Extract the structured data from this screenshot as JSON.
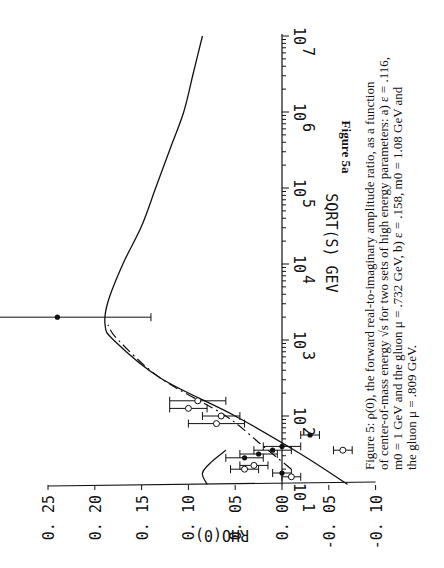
{
  "figure": {
    "label": "Figure 5a",
    "caption_lines": [
      "Figure 5: ρ(0), the forward real-to-imaginary amplitude ratio, as a function",
      "of center-of-mass energy √s for two sets of high energy parameters: a) ε = .116,",
      "m0 = 1 GeV and the gluon μ = .732 GeV, b) ε = .158, m0 = 1.08 GeV and",
      "the gluon μ = .809 GeV."
    ],
    "orientation": "rotated 90° clockwise"
  },
  "chart_data": {
    "type": "line",
    "title": "",
    "xlabel": "SQRT(S) GEV",
    "ylabel": "RHO(0)",
    "x_scale": "log",
    "x_tick_labels": [
      "10^1",
      "10^2",
      "10^3",
      "10^4",
      "10^5",
      "10^6",
      "10^7"
    ],
    "y_tick_labels": [
      "0.25",
      "0.20",
      "0.15",
      "0.10",
      "0.05",
      "0.00",
      "-0.05",
      "-0.10"
    ],
    "ylim": [
      -0.1,
      0.25
    ],
    "xlim_log10": [
      1.1,
      7.0
    ],
    "grid": false,
    "series": [
      {
        "name": "a) eps=.116, m0=1 GeV, gluon mu=.732 GeV (solid)",
        "style": "solid",
        "log10_sqrt_s": [
          1.1,
          1.5,
          2.0,
          2.5,
          3.0,
          3.2,
          3.5,
          4.0,
          4.5,
          5.0,
          5.5,
          6.0,
          6.5,
          7.0
        ],
        "rho": [
          -0.07,
          -0.02,
          0.05,
          0.13,
          0.18,
          0.189,
          0.186,
          0.17,
          0.15,
          0.135,
          0.12,
          0.105,
          0.095,
          0.085
        ]
      },
      {
        "name": "b) eps=.158, m0=1.08 GeV, gluon mu=.809 GeV (dashed)",
        "style": "dashed",
        "log10_sqrt_s": [
          1.3,
          1.6,
          2.0,
          2.5,
          3.0,
          3.2
        ],
        "rho": [
          -0.01,
          0.02,
          0.06,
          0.13,
          0.175,
          0.186
        ]
      },
      {
        "name": "low-energy curve",
        "style": "solid",
        "log10_sqrt_s": [
          1.1,
          1.25,
          1.4,
          1.55
        ],
        "rho": [
          0.08,
          0.085,
          0.075,
          0.06
        ]
      }
    ],
    "data_points": [
      {
        "log10_sqrt_s": 3.3,
        "rho": 0.24,
        "rho_err": 0.1,
        "marker": "filled"
      },
      {
        "log10_sqrt_s": 1.75,
        "rho": -0.03,
        "rho_err": 0.01,
        "marker": "filled"
      },
      {
        "log10_sqrt_s": 1.55,
        "rho": -0.065,
        "rho_err": 0.01,
        "marker": "open"
      },
      {
        "log10_sqrt_s": 1.6,
        "rho": 0.0,
        "rho_err": 0.02,
        "marker": "filled"
      },
      {
        "log10_sqrt_s": 1.55,
        "rho": 0.01,
        "rho_err": 0.02,
        "marker": "filled"
      },
      {
        "log10_sqrt_s": 1.5,
        "rho": 0.025,
        "rho_err": 0.02,
        "marker": "filled"
      },
      {
        "log10_sqrt_s": 1.45,
        "rho": 0.04,
        "rho_err": 0.02,
        "marker": "filled"
      },
      {
        "log10_sqrt_s": 1.9,
        "rho": 0.07,
        "rho_err": 0.03,
        "marker": "open"
      },
      {
        "log10_sqrt_s": 2.0,
        "rho": 0.065,
        "rho_err": 0.02,
        "marker": "open"
      },
      {
        "log10_sqrt_s": 2.1,
        "rho": 0.1,
        "rho_err": 0.02,
        "marker": "open"
      },
      {
        "log10_sqrt_s": 2.2,
        "rho": 0.09,
        "rho_err": 0.03,
        "marker": "open"
      },
      {
        "log10_sqrt_s": 1.35,
        "rho": 0.03,
        "rho_err": 0.015,
        "marker": "open"
      },
      {
        "log10_sqrt_s": 1.3,
        "rho": 0.04,
        "rho_err": 0.015,
        "marker": "open"
      },
      {
        "log10_sqrt_s": 1.25,
        "rho": 0.0,
        "rho_err": 0.01,
        "marker": "filled"
      },
      {
        "log10_sqrt_s": 1.2,
        "rho": -0.01,
        "rho_err": 0.01,
        "marker": "open"
      }
    ],
    "legend": []
  },
  "axis_titles": {
    "x": "SQRT(S) GEV",
    "y": "RHO(0)"
  },
  "tick_labels": {
    "rho": [
      "0. 25",
      "0. 20",
      "0. 15",
      "0. 10",
      "0. 05",
      "0. 00",
      "-0. 05",
      "-0. 10"
    ],
    "energy_base": "10",
    "energy_exp": [
      "1",
      "2",
      "3",
      "4",
      "5",
      "6",
      "7"
    ]
  }
}
